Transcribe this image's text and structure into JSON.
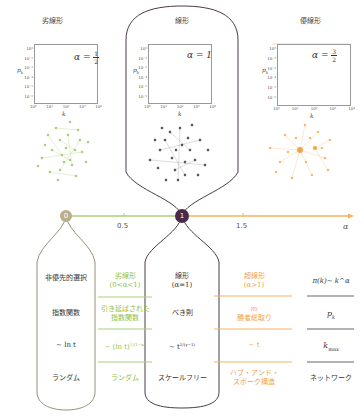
{
  "colors": {
    "sublinear": "#8fbf45",
    "linear": "#4a2a4a",
    "superlinear": "#f0a34a",
    "zero_node": "#b9ad8a",
    "neutral_line": "#555555"
  },
  "panels": [
    {
      "title": "劣線形",
      "alpha_label": "α =",
      "alpha_num": "1",
      "alpha_den": "2",
      "y_label": "p_k",
      "x_label": "k",
      "y_ticks": [
        "10⁰",
        "10⁻¹",
        "10⁻²",
        "10⁻⁴",
        "10⁻⁵",
        "10⁻⁶"
      ],
      "x_ticks": [
        "10⁰",
        "10¹",
        "10²",
        "10³",
        "10⁴"
      ]
    },
    {
      "title": "線形",
      "alpha_label": "α = 1",
      "y_label": "p_k",
      "x_label": "k",
      "y_ticks": [
        "10⁰",
        "10⁻¹",
        "10⁻²",
        "10⁻⁴",
        "10⁻⁵",
        "10⁻⁶"
      ],
      "x_ticks": [
        "10⁰",
        "10¹",
        "10²",
        "10³",
        "10⁴"
      ]
    },
    {
      "title": "優線形",
      "alpha_label": "α =",
      "alpha_num": "3",
      "alpha_den": "2",
      "y_label": "p_k",
      "x_label": "k",
      "y_ticks": [
        "10⁰",
        "10⁻¹",
        "10⁻²",
        "10⁻⁴",
        "10⁻⁵",
        "10⁻⁶"
      ],
      "x_ticks": [
        "10⁰",
        "10¹",
        "10²",
        "10³",
        "10⁴"
      ]
    }
  ],
  "axis": {
    "zero_label": "0",
    "one_label": "1",
    "tick_05": "0.5",
    "tick_15": "1.5",
    "alpha_label": "α"
  },
  "table": {
    "col0": [
      "非優先的選択",
      "指数関数",
      "∼ ln t",
      "ランダム"
    ],
    "col1": {
      "header_line1": "劣線形",
      "header_line2": "(0<α<1)",
      "row1_line1": "引き延ばされた",
      "row1_line2": "指数関数",
      "row2": "∼ (ln t)",
      "row2_exp": "1/(1−α)",
      "row3": "ランダム"
    },
    "col2": {
      "header_line1": "線形",
      "header_line2": "(α=1)",
      "row1": "べき則",
      "row2": "∼ t",
      "row2_exp": "1/(γ−1)",
      "row3": "スケールフリー"
    },
    "col3": {
      "header_line1": "超線形",
      "header_line2": "(α>1)",
      "row1_line1": "m",
      "row1_line2": "勝者総取り",
      "row2": "∼ t",
      "row3_line1": "ハブ・アンド・",
      "row3_line2": "スポーク構造"
    },
    "col4": {
      "header": "π(k)∼ k^α",
      "row1": "p_k",
      "row2": "k_max",
      "row3": "ネットワーク"
    }
  }
}
